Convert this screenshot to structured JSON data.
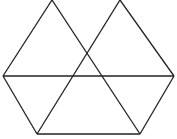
{
  "diagram": {
    "stroke_color": "#222222",
    "background": "#ffffff",
    "lines": [
      {
        "x1": 52,
        "y1": 0,
        "x2": 3,
        "y2": 76
      },
      {
        "x1": 52,
        "y1": 0,
        "x2": 140,
        "y2": 134
      },
      {
        "x1": 120,
        "y1": 0,
        "x2": 174,
        "y2": 76
      },
      {
        "x1": 120,
        "y1": 0,
        "x2": 37,
        "y2": 134
      },
      {
        "x1": 3,
        "y1": 76,
        "x2": 174,
        "y2": 76
      },
      {
        "x1": 3,
        "y1": 76,
        "x2": 37,
        "y2": 134
      },
      {
        "x1": 174,
        "y1": 76,
        "x2": 140,
        "y2": 134
      },
      {
        "x1": 37,
        "y1": 134,
        "x2": 140,
        "y2": 134
      }
    ]
  }
}
